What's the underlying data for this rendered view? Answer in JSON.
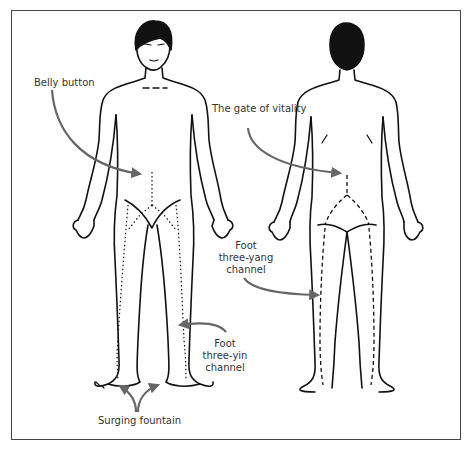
{
  "diagram": {
    "views": [
      "front",
      "back"
    ],
    "labels": {
      "belly_button": "Belly button",
      "gate_of_vitality": "The gate of vitality",
      "foot_three_yang": [
        "Foot",
        "three-yang",
        "channel"
      ],
      "foot_three_yin": [
        "Foot",
        "three-yin",
        "channel"
      ],
      "surging_fountain": "Surging fountain"
    },
    "colors": {
      "outline": "#111111",
      "arrow": "#666666",
      "frame": "#444444",
      "text": "#333333"
    }
  }
}
